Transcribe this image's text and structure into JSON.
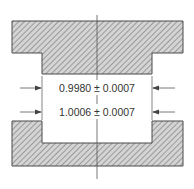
{
  "diagram": {
    "type": "fit-tolerance-drawing",
    "parts": [
      {
        "name": "shaft-key",
        "profile": "T-shaped tongue, hatched section"
      },
      {
        "name": "slot-part",
        "profile": "U-shaped slot, hatched section"
      }
    ],
    "dimensions": [
      {
        "id": "tongue-width",
        "label": "0.9980 ± 0.0007"
      },
      {
        "id": "slot-width",
        "label": "1.0006 ± 0.0007"
      }
    ],
    "colors": {
      "outline": "#4a4a4a",
      "fill": "#d4d4d4",
      "hatch": "#6a6a6a",
      "text": "#333333"
    }
  }
}
